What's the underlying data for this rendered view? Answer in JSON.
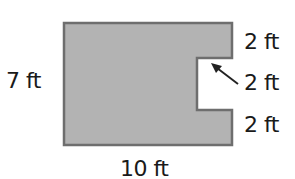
{
  "figure": {
    "shape": "rectangle-with-rectangular-notch",
    "colors": {
      "fill": "#b3b3b3",
      "stroke": "#6e6e6e",
      "arrow": "#222222",
      "text": "#1a1a1a",
      "background": "#ffffff"
    },
    "labels": {
      "height": "7 ft",
      "width": "10 ft",
      "right_top": "2 ft",
      "right_middle": "2 ft",
      "right_bottom": "2 ft"
    },
    "dimensions": {
      "outer_height_ft": 7,
      "outer_width_ft": 10,
      "right_top_segment_ft": 2,
      "notch_ft": 2,
      "right_bottom_segment_ft": 2
    }
  }
}
